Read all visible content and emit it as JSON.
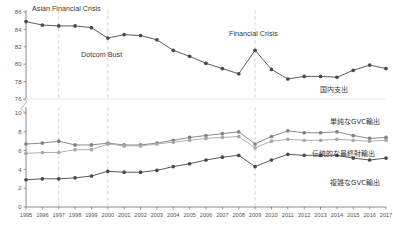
{
  "chart_data": [
    {
      "type": "line",
      "panel": "top",
      "title": "",
      "xlabel": "",
      "ylabel": "",
      "ylim": [
        76,
        86
      ],
      "yticks": [
        76,
        78,
        80,
        82,
        84,
        86
      ],
      "xlim": [
        1995,
        2017
      ],
      "grid": false,
      "legend_position": "inline-right",
      "categories": [
        1995,
        1996,
        1997,
        1998,
        1999,
        2000,
        2001,
        2002,
        2003,
        2004,
        2005,
        2006,
        2007,
        2008,
        2009,
        2010,
        2011,
        2012,
        2013,
        2014,
        2015,
        2016,
        2017
      ],
      "series": [
        {
          "name": "国内支出",
          "color": "#4a4a4a",
          "values": [
            84.9,
            84.5,
            84.4,
            84.4,
            84.2,
            83.0,
            83.4,
            83.3,
            82.8,
            81.6,
            80.9,
            80.1,
            79.5,
            78.9,
            81.6,
            79.4,
            78.3,
            78.6,
            78.6,
            78.5,
            79.3,
            79.9,
            79.5
          ]
        }
      ],
      "annotations": [
        {
          "text": "Asian Financial Crisis",
          "x": 1997
        },
        {
          "text": "Dotcom Bust",
          "x": 2000
        },
        {
          "text": "Financial Crisis",
          "x": 2009
        }
      ]
    },
    {
      "type": "line",
      "panel": "bottom",
      "title": "",
      "xlabel": "",
      "ylabel": "",
      "ylim": [
        0,
        10
      ],
      "yticks": [
        0,
        2,
        4,
        6,
        8,
        10
      ],
      "xlim": [
        1995,
        2017
      ],
      "grid": false,
      "legend_position": "inline-right",
      "categories": [
        1995,
        1996,
        1997,
        1998,
        1999,
        2000,
        2001,
        2002,
        2003,
        2004,
        2005,
        2006,
        2007,
        2008,
        2009,
        2010,
        2011,
        2012,
        2013,
        2014,
        2015,
        2016,
        2017
      ],
      "series": [
        {
          "name": "単純なGVC輸出",
          "color": "#808080",
          "values": [
            6.7,
            6.8,
            7.0,
            6.6,
            6.6,
            6.8,
            6.6,
            6.6,
            6.8,
            7.1,
            7.4,
            7.6,
            7.8,
            8.0,
            6.7,
            7.5,
            8.1,
            7.9,
            7.9,
            8.0,
            7.6,
            7.3,
            7.4
          ]
        },
        {
          "name": "伝統的な最終財輸出",
          "color": "#a8a8a8",
          "values": [
            5.7,
            5.8,
            5.8,
            6.1,
            6.1,
            6.7,
            6.5,
            6.5,
            6.7,
            6.9,
            7.1,
            7.3,
            7.4,
            7.5,
            6.3,
            7.0,
            7.2,
            7.1,
            7.1,
            7.2,
            7.1,
            7.0,
            7.1
          ]
        },
        {
          "name": "複雑なGVC輸出",
          "color": "#4a4a4a",
          "values": [
            2.9,
            3.0,
            3.0,
            3.1,
            3.3,
            3.8,
            3.7,
            3.7,
            3.9,
            4.3,
            4.6,
            5.0,
            5.3,
            5.5,
            4.3,
            5.0,
            5.6,
            5.5,
            5.5,
            5.5,
            5.2,
            5.0,
            5.2
          ]
        }
      ],
      "annotations": [
        {
          "text": "",
          "x": 1997
        },
        {
          "text": "",
          "x": 2000
        },
        {
          "text": "",
          "x": 2009
        }
      ]
    }
  ],
  "axis": {
    "top_yticks": [
      "86",
      "84",
      "82",
      "80",
      "78",
      "76"
    ],
    "bottom_yticks": [
      "10",
      "8",
      "6",
      "4",
      "2",
      "0"
    ],
    "xticks": [
      "1995",
      "1996",
      "1997",
      "1998",
      "1999",
      "2000",
      "2001",
      "2002",
      "2003",
      "2004",
      "2005",
      "2006",
      "2007",
      "2008",
      "2009",
      "2010",
      "2011",
      "2012",
      "2013",
      "2014",
      "2015",
      "2016",
      "2017"
    ]
  },
  "annotations": {
    "asian_financial_crisis": "Asian Financial Crisis",
    "dotcom_bust": "Dotcom Bust",
    "financial_crisis": "Financial Crisis"
  },
  "series_labels": {
    "domestic_expenditure": "国内支出",
    "simple_gvc_exports": "単純なGVC輸出",
    "traditional_final_goods_exports": "伝統的な最終財輸出",
    "complex_gvc_exports": "複雑なGVC輸出"
  },
  "colors": {
    "dark": "#4a4a4a",
    "mid_gray": "#808080",
    "light_gray": "#a8a8a8",
    "event_line": "#d8d8d8",
    "axis": "#6d6d6d"
  }
}
